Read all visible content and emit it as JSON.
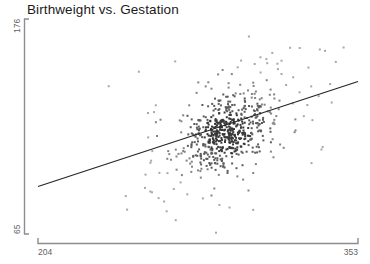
{
  "chart_data": {
    "type": "scatter",
    "title": "Birthweight vs. Gestation",
    "xlabel": "",
    "ylabel": "",
    "xlim": [
      204,
      353
    ],
    "ylim": [
      65,
      176
    ],
    "xticks": [
      "204",
      "353"
    ],
    "yticks": [
      "65",
      "176"
    ],
    "grid": false,
    "legend": null,
    "marker": {
      "shape": "square",
      "size_px": 2,
      "color": "#8a8a8a"
    },
    "trendline": {
      "present": true,
      "type": "linear",
      "color": "#262626",
      "x_start": 204,
      "y_start": 93,
      "x_end": 353,
      "y_end": 148
    },
    "n_points": 640,
    "cluster": {
      "x_center": 292,
      "y_center": 121,
      "x_spread": 14,
      "y_spread": 14
    },
    "correlation": 0.45
  },
  "axes": {
    "y_axis": {
      "tick_top_label": "176",
      "tick_bottom_label": "65",
      "line_color": "#8d8d8d"
    },
    "x_axis": {
      "tick_left_label": "204",
      "tick_right_label": "353",
      "line_color": "#8d8d8d"
    }
  }
}
